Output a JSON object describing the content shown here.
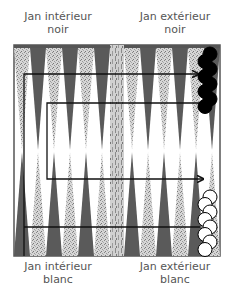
{
  "labels": {
    "top_left": {
      "line1": "Jan intérieur",
      "line2": "noir"
    },
    "top_right": {
      "line1": "Jan extérieur",
      "line2": "noir"
    },
    "bottom_left": {
      "line1": "Jan intérieur",
      "line2": "blanc"
    },
    "bottom_right": {
      "line1": "Jan extérieur",
      "line2": "blanc"
    }
  },
  "board": {
    "points_per_side": 12,
    "colors": {
      "frame": "#555555",
      "dark_point": "#5a5a5a",
      "light_point": "#c8c8c8",
      "bar": "#bdbdbd",
      "black_checker": "#000000",
      "white_checker": "#ffffff",
      "path_line": "#111111"
    },
    "black_checkers": 8,
    "white_checkers": 8
  }
}
